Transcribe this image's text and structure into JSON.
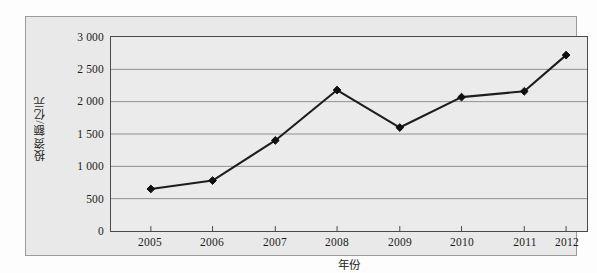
{
  "chart_data": {
    "type": "line",
    "title": "",
    "subtitle": "",
    "xlabel": "年份",
    "ylabel": "投资额/亿元",
    "categories": [
      "2005",
      "2006",
      "2007",
      "2008",
      "2009",
      "2010",
      "2011",
      "2012"
    ],
    "values": [
      650,
      780,
      1400,
      2180,
      1600,
      2070,
      2160,
      2720
    ],
    "series": [
      {
        "name": "投资额",
        "values": [
          650,
          780,
          1400,
          2180,
          1600,
          2070,
          2160,
          2720
        ]
      }
    ],
    "x_tick_labels": [
      "2005",
      "2006",
      "2007",
      "2008",
      "2009",
      "2010",
      "2011",
      "2012"
    ],
    "y_tick_labels": [
      "0",
      "500",
      "1 000",
      "1 500",
      "2 000",
      "2 500",
      "3 000"
    ],
    "y_tick_values": [
      0,
      500,
      1000,
      1500,
      2000,
      2500,
      3000
    ],
    "ylim": [
      0,
      3000
    ],
    "grid": "horizontal",
    "legend": "none",
    "marker": "diamond",
    "line_color": "#1d1d1d",
    "marker_color": "#101010",
    "grid_color": "#8f8f8f",
    "axis_color": "#4a4a4a",
    "plot_background": "#ebebeb",
    "frame_background": "#e9e9e9"
  }
}
